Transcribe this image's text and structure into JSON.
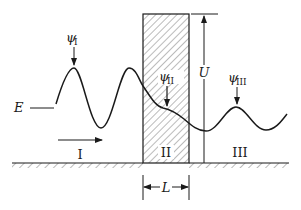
{
  "diagram": {
    "labels": {
      "psi1": "ψ",
      "psi1_sub": "I",
      "psi2": "ψ",
      "psi2_sub": "II",
      "psi3": "ψ",
      "psi3_sub": "III",
      "energy": "E",
      "height": "U",
      "width": "L",
      "region1": "I",
      "region2": "II",
      "region3": "III"
    },
    "colors": {
      "ink": "#1a1a1a",
      "hatch": "#555555",
      "background": "#ffffff"
    }
  }
}
